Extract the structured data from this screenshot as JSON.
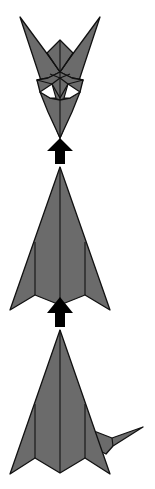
{
  "diagram": {
    "type": "origami-folding-sequence",
    "direction": "bottom-to-top",
    "colors": {
      "paper": "#6b6b6b",
      "outline": "#111111",
      "arrow": "#000000",
      "background": "#ffffff"
    },
    "steps": [
      {
        "name": "step-final-head",
        "description": "folded figure with two ears and white eye openings"
      },
      {
        "name": "step-kite-base",
        "description": "arrow-shaped base with center and side creases"
      },
      {
        "name": "step-kite-with-tail",
        "description": "arrow-shaped base with tail flap on right"
      }
    ],
    "arrows": [
      {
        "name": "arrow-step-2-to-1",
        "direction": "up"
      },
      {
        "name": "arrow-step-3-to-2",
        "direction": "up"
      }
    ]
  }
}
